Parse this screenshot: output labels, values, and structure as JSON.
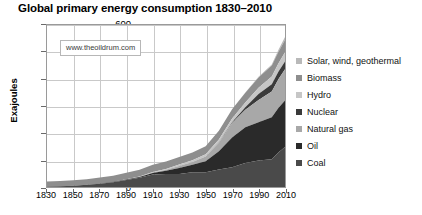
{
  "chart_data": {
    "type": "area",
    "stacked": true,
    "title": "Global primary energy consumption 1830–2010",
    "xlabel": "",
    "ylabel": "Exajoules",
    "xlim": [
      1830,
      2010
    ],
    "ylim": [
      0,
      600
    ],
    "ytick_labels": [
      "0",
      "100",
      "200",
      "300",
      "400",
      "500",
      "600"
    ],
    "ytick_values": [
      0,
      100,
      200,
      300,
      400,
      500,
      600
    ],
    "xtick_labels": [
      "1830",
      "1850",
      "1870",
      "1890",
      "1910",
      "1930",
      "1950",
      "1970",
      "1990",
      "2010"
    ],
    "xtick_values": [
      1830,
      1850,
      1870,
      1890,
      1910,
      1930,
      1950,
      1970,
      1990,
      2010
    ],
    "grid": true,
    "legend_position": "right",
    "watermark": "www.theoildrum.com",
    "x": [
      1830,
      1840,
      1850,
      1860,
      1870,
      1880,
      1890,
      1900,
      1910,
      1920,
      1930,
      1940,
      1950,
      1960,
      1970,
      1980,
      1990,
      2000,
      2005,
      2010
    ],
    "series": [
      {
        "name": "Coal",
        "color": "#4a4a4a",
        "values": [
          2,
          3,
          5,
          8,
          12,
          18,
          26,
          34,
          46,
          48,
          48,
          55,
          55,
          65,
          73,
          89,
          98,
          103,
          128,
          148
        ]
      },
      {
        "name": "Oil",
        "color": "#2a2a2a",
        "values": [
          0,
          0,
          0,
          0,
          1,
          1,
          2,
          3,
          6,
          12,
          22,
          27,
          40,
          67,
          110,
          132,
          142,
          155,
          165,
          172
        ]
      },
      {
        "name": "Natural gas",
        "color": "#a8a8a8",
        "values": [
          0,
          0,
          0,
          0,
          0,
          0,
          1,
          1,
          2,
          4,
          8,
          11,
          18,
          32,
          54,
          65,
          82,
          96,
          106,
          116
        ]
      },
      {
        "name": "Nuclear",
        "color": "#3a3a3a",
        "values": [
          0,
          0,
          0,
          0,
          0,
          0,
          0,
          0,
          0,
          0,
          0,
          0,
          0,
          1,
          3,
          9,
          22,
          27,
          28,
          29
        ]
      },
      {
        "name": "Hydro",
        "color": "#c6c6c6",
        "values": [
          0,
          0,
          0,
          0,
          0,
          0,
          0,
          1,
          2,
          3,
          5,
          6,
          8,
          11,
          14,
          18,
          24,
          28,
          30,
          34
        ]
      },
      {
        "name": "Biomass",
        "color": "#8e8e8e",
        "values": [
          18,
          19,
          20,
          21,
          22,
          23,
          24,
          25,
          26,
          27,
          28,
          29,
          30,
          32,
          34,
          36,
          38,
          41,
          43,
          45
        ]
      },
      {
        "name": "Solar, wind, geothermal",
        "color": "#b9b9b9",
        "values": [
          0,
          0,
          0,
          0,
          0,
          0,
          0,
          0,
          0,
          0,
          0,
          0,
          0,
          0,
          0,
          1,
          2,
          4,
          7,
          12
        ]
      }
    ],
    "legend_order": [
      "Solar, wind, geothermal",
      "Biomass",
      "Hydro",
      "Nuclear",
      "Natural gas",
      "Oil",
      "Coal"
    ]
  }
}
